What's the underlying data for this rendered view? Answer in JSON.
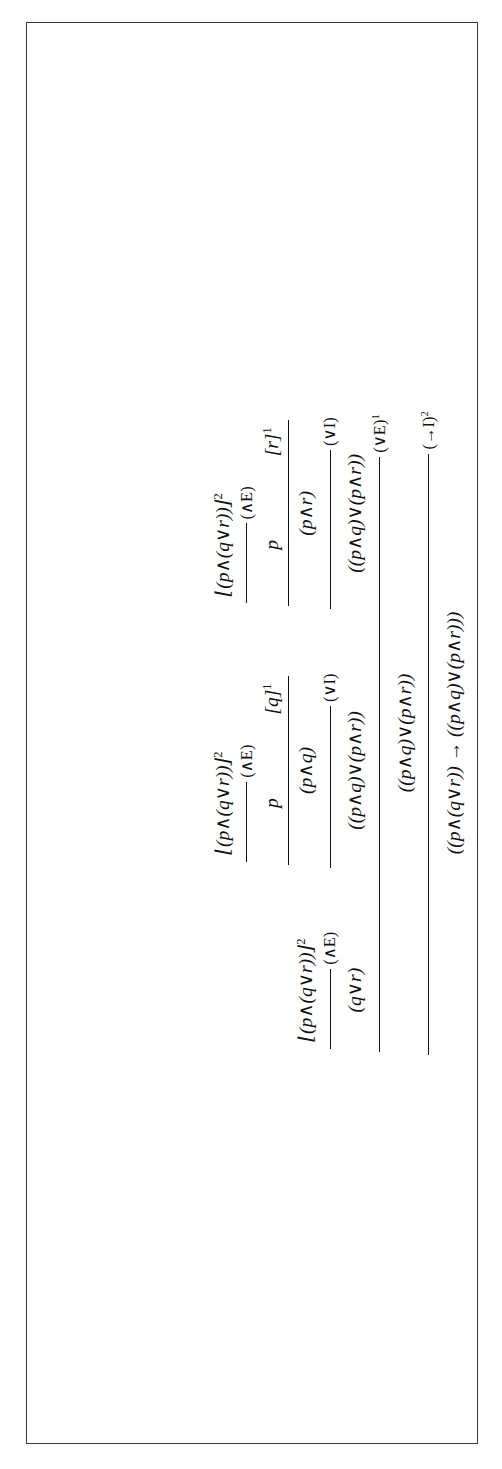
{
  "document": {
    "kind": "natural-deduction-proof-figure",
    "orientation": "rotated-90-counterclockwise",
    "page_background": "#ffffff",
    "frame_color": "#3a3a3a",
    "ink_color": "#111111"
  },
  "symbols": {
    "and": "∧",
    "or": "∨",
    "implies": "→",
    "discharge_open": "⌊",
    "discharge_close": "⌋",
    "bracket_open": "[",
    "bracket_close": "]"
  },
  "proof": {
    "name": "distributivity-of-and-over-or",
    "conclusion": "((p∧(q∨r)) → ((p∧q)∨(p∧r)))",
    "final_rule": "(→I)",
    "final_rule_mark": "2",
    "branches": {
      "left": {
        "label": "major-premise-branch",
        "assumption": "⌊(p∧(q∨r))⌋",
        "assumption_mark": "2",
        "conclusion": "(q∨r)",
        "rule": "(∧E)"
      },
      "middle": {
        "label": "left-disjunct-branch",
        "assumption": "⌊(p∧(q∨r))⌋",
        "assumption_mark": "2",
        "and_elim_conclusion": "p",
        "and_elim_rule": "(∧E)",
        "temp_assumption": "[q]",
        "temp_assumption_mark": "1",
        "conjunction": "(p∧q)",
        "disjunction": "((p∧q)∨(p∧r))",
        "disjunction_rule": "(∨I)"
      },
      "right": {
        "label": "right-disjunct-branch",
        "assumption": "⌊(p∧(q∨r))⌋",
        "assumption_mark": "2",
        "and_elim_conclusion": "p",
        "and_elim_rule": "(∧E)",
        "temp_assumption": "[r]",
        "temp_assumption_mark": "1",
        "conjunction": "(p∧r)",
        "disjunction": "((p∧q)∨(p∧r))",
        "disjunction_rule": "(∨I)"
      }
    },
    "or_elim": {
      "conclusion": "((p∧q)∨(p∧r))",
      "rule": "(∨E)",
      "rule_mark": "1"
    }
  }
}
